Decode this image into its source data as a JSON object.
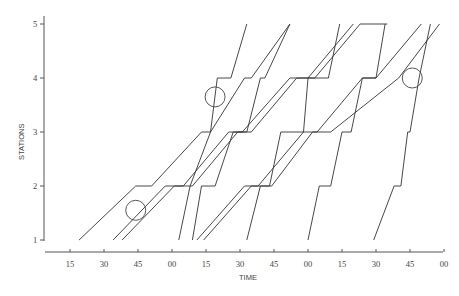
{
  "chart_data": {
    "type": "line",
    "subtype": "time-space train diagram",
    "title": "",
    "xlabel": "TIME",
    "ylabel": "STATIONS",
    "x_ticks": [
      "15",
      "30",
      "45",
      "00",
      "15",
      "30",
      "45",
      "00",
      "15",
      "30",
      "45",
      "00"
    ],
    "x_tick_minutes": [
      15,
      30,
      45,
      60,
      75,
      90,
      105,
      120,
      135,
      150,
      165,
      180
    ],
    "y_ticks": [
      "1",
      "2",
      "3",
      "4",
      "5"
    ],
    "xlim": [
      3,
      180
    ],
    "ylim": [
      1,
      5
    ],
    "grid": false,
    "legend": null,
    "series": [
      {
        "name": "slow-train-1",
        "points": [
          [
            19,
            1
          ],
          [
            44,
            2
          ],
          [
            51,
            2
          ],
          [
            73,
            3
          ],
          [
            77,
            3
          ],
          [
            92,
            4
          ],
          [
            95,
            4
          ],
          [
            112,
            5
          ]
        ]
      },
      {
        "name": "slow-train-2",
        "points": [
          [
            34,
            1
          ],
          [
            57,
            2
          ],
          [
            65,
            2
          ],
          [
            85,
            3
          ],
          [
            91,
            3
          ],
          [
            112,
            4
          ],
          [
            120,
            4
          ],
          [
            140,
            5
          ]
        ]
      },
      {
        "name": "slow-train-3",
        "points": [
          [
            38,
            1
          ],
          [
            61,
            2
          ],
          [
            69,
            2
          ],
          [
            89,
            3
          ],
          [
            95,
            3
          ],
          [
            115,
            4
          ],
          [
            123,
            4
          ],
          [
            143,
            5
          ],
          [
            155,
            5
          ]
        ]
      },
      {
        "name": "slow-train-4",
        "points": [
          [
            71,
            1
          ],
          [
            92,
            2
          ],
          [
            98,
            2
          ],
          [
            118,
            3
          ],
          [
            124,
            3
          ],
          [
            144,
            4
          ],
          [
            150,
            4
          ],
          [
            170,
            5
          ]
        ]
      },
      {
        "name": "slow-train-5",
        "points": [
          [
            74,
            1
          ],
          [
            95,
            2
          ],
          [
            104,
            2
          ],
          [
            122,
            3
          ],
          [
            130,
            3
          ],
          [
            160,
            4
          ],
          [
            178,
            5
          ]
        ]
      },
      {
        "name": "fast-train-1",
        "points": [
          [
            63,
            1
          ],
          [
            68,
            2
          ],
          [
            77,
            3
          ],
          [
            80,
            4
          ],
          [
            86,
            4
          ],
          [
            93,
            5
          ]
        ]
      },
      {
        "name": "fast-train-2",
        "points": [
          [
            69,
            1
          ],
          [
            73,
            2
          ],
          [
            79,
            2
          ],
          [
            87,
            3
          ],
          [
            93,
            3
          ],
          [
            99,
            4
          ],
          [
            101,
            4
          ],
          [
            112,
            5
          ]
        ]
      },
      {
        "name": "fast-train-3",
        "points": [
          [
            93,
            1
          ],
          [
            99,
            2
          ],
          [
            103,
            2
          ],
          [
            108,
            3
          ],
          [
            118,
            3
          ],
          [
            120,
            4
          ],
          [
            129,
            4
          ],
          [
            134,
            5
          ]
        ]
      },
      {
        "name": "fast-train-4",
        "points": [
          [
            120,
            1
          ],
          [
            125,
            2
          ],
          [
            130,
            2
          ],
          [
            135,
            3
          ],
          [
            139,
            3
          ],
          [
            144,
            4
          ],
          [
            150,
            4
          ],
          [
            154,
            5
          ]
        ]
      },
      {
        "name": "fast-train-5",
        "points": [
          [
            149,
            1
          ],
          [
            158,
            2
          ],
          [
            161,
            2
          ],
          [
            164,
            3
          ],
          [
            165,
            3
          ],
          [
            169,
            4
          ],
          [
            174,
            5
          ]
        ]
      }
    ],
    "annotations": [
      {
        "type": "circle",
        "label": "overtake-point-1",
        "at": [
          44,
          1.55
        ]
      },
      {
        "type": "circle",
        "label": "overtake-point-2",
        "at": [
          79,
          3.65
        ]
      },
      {
        "type": "circle",
        "label": "overtake-point-3",
        "at": [
          166,
          4.0
        ]
      }
    ]
  }
}
